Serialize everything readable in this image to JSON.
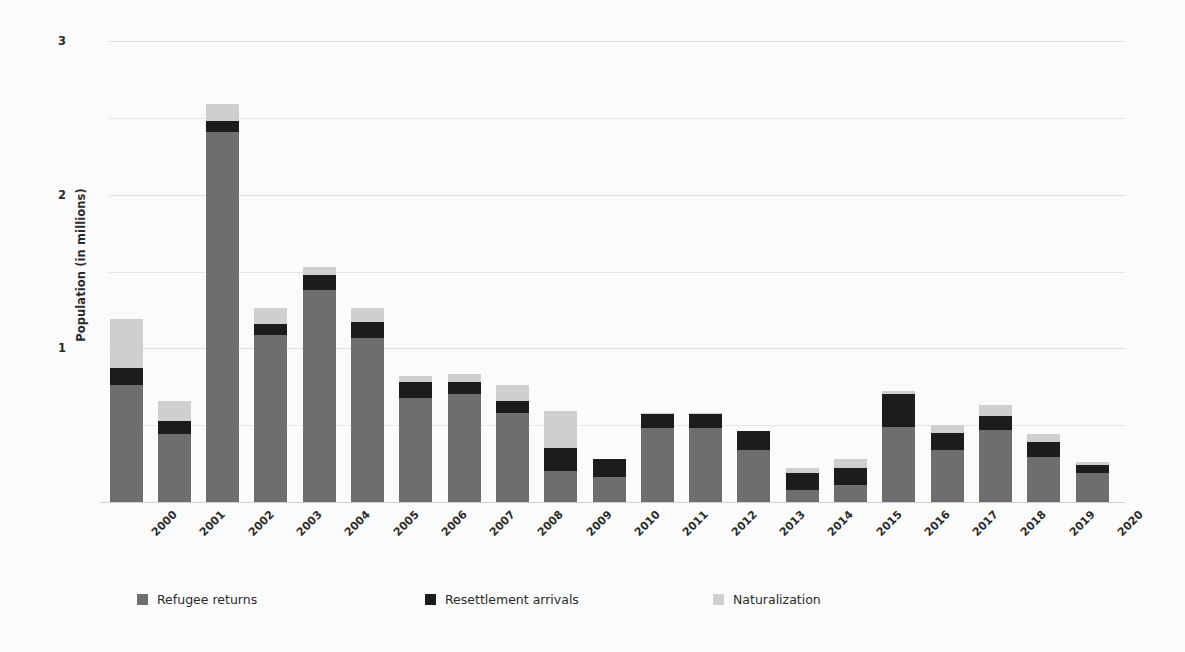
{
  "chart_data": {
    "type": "bar",
    "stacked": true,
    "title": "",
    "xlabel": "",
    "ylabel": "Population (in millions)",
    "ylim": [
      0,
      3
    ],
    "yticks": [
      0,
      0.5,
      1,
      1.5,
      2,
      2.5,
      3
    ],
    "ytick_labels": [
      "",
      "",
      "1",
      "",
      "2",
      "",
      "3"
    ],
    "grid": true,
    "legend_position": "bottom",
    "categories": [
      "2000",
      "2001",
      "2002",
      "2003",
      "2004",
      "2005",
      "2006",
      "2007",
      "2008",
      "2009",
      "2010",
      "2011",
      "2012",
      "2013",
      "2014",
      "2015",
      "2016",
      "2017",
      "2018",
      "2019",
      "2020"
    ],
    "series": [
      {
        "name": "Refugee returns",
        "color": "#6e6e6e",
        "values": [
          0.76,
          0.44,
          2.41,
          1.09,
          1.38,
          1.07,
          0.68,
          0.7,
          0.58,
          0.2,
          0.16,
          0.48,
          0.48,
          0.34,
          0.08,
          0.11,
          0.49,
          0.34,
          0.47,
          0.29,
          0.19
        ]
      },
      {
        "name": "Resettlement arrivals",
        "color": "#1c1c1c",
        "values": [
          0.11,
          0.09,
          0.07,
          0.07,
          0.1,
          0.1,
          0.1,
          0.08,
          0.08,
          0.15,
          0.12,
          0.09,
          0.09,
          0.12,
          0.11,
          0.11,
          0.21,
          0.11,
          0.09,
          0.1,
          0.05
        ]
      },
      {
        "name": "Naturalization",
        "color": "#cfcfcf",
        "values": [
          0.32,
          0.13,
          0.11,
          0.1,
          0.05,
          0.09,
          0.04,
          0.05,
          0.1,
          0.24,
          0.0,
          0.01,
          0.01,
          0.0,
          0.03,
          0.06,
          0.02,
          0.05,
          0.07,
          0.05,
          0.02
        ]
      }
    ],
    "legend": [
      {
        "label": "Refugee returns",
        "color": "#6e6e6e"
      },
      {
        "label": "Resettlement arrivals",
        "color": "#1c1c1c"
      },
      {
        "label": "Naturalization",
        "color": "#cfcfcf"
      }
    ]
  }
}
